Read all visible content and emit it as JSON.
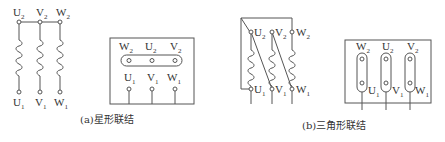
{
  "diagram": {
    "star": {
      "schematic_labels_top": [
        {
          "letter": "U",
          "sub": "2"
        },
        {
          "letter": "V",
          "sub": "2"
        },
        {
          "letter": "W",
          "sub": "2"
        }
      ],
      "schematic_labels_bottom": [
        {
          "letter": "U",
          "sub": "1"
        },
        {
          "letter": "V",
          "sub": "1"
        },
        {
          "letter": "W",
          "sub": "1"
        }
      ],
      "box_labels_top": [
        {
          "letter": "W",
          "sub": "2"
        },
        {
          "letter": "U",
          "sub": "2"
        },
        {
          "letter": "V",
          "sub": "2"
        }
      ],
      "box_labels_bottom": [
        {
          "letter": "U",
          "sub": "1"
        },
        {
          "letter": "V",
          "sub": "1"
        },
        {
          "letter": "W",
          "sub": "1"
        }
      ],
      "caption": "(a)星形联结"
    },
    "delta": {
      "schematic_labels_top": [
        {
          "letter": "U",
          "sub": "2"
        },
        {
          "letter": "V",
          "sub": "2"
        },
        {
          "letter": "W",
          "sub": "2"
        }
      ],
      "schematic_labels_bottom": [
        {
          "letter": "U",
          "sub": "1"
        },
        {
          "letter": "V",
          "sub": "1"
        },
        {
          "letter": "W",
          "sub": "1"
        }
      ],
      "box_labels_top": [
        {
          "letter": "W",
          "sub": "2"
        },
        {
          "letter": "U",
          "sub": "2"
        },
        {
          "letter": "V",
          "sub": "2"
        }
      ],
      "box_labels_bottom": [
        {
          "letter": "U",
          "sub": "1"
        },
        {
          "letter": "V",
          "sub": "1"
        },
        {
          "letter": "W",
          "sub": "1"
        }
      ],
      "caption": "(b)三角形联结"
    }
  }
}
